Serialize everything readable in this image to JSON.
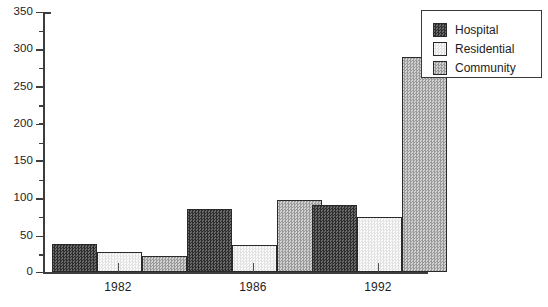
{
  "chart_data": {
    "type": "bar",
    "title": "",
    "xlabel": "",
    "ylabel": "",
    "categories": [
      "1982",
      "1986",
      "1992"
    ],
    "series": [
      {
        "name": "Hospital",
        "values": [
          38,
          85,
          90
        ],
        "pattern": "dark-checker",
        "color": "#4a4a4a"
      },
      {
        "name": "Residential",
        "values": [
          27,
          37,
          74
        ],
        "pattern": "light-checker",
        "color": "#f2f2f2"
      },
      {
        "name": "Community",
        "values": [
          21,
          97,
          290
        ],
        "pattern": "medium-checker",
        "color": "#b4b4b4"
      }
    ],
    "ylim": [
      0,
      350
    ],
    "ytick_major": [
      0,
      50,
      100,
      150,
      200,
      250,
      300,
      350
    ],
    "ytick_minor": [
      25,
      75,
      125,
      175,
      225,
      275,
      325
    ],
    "grid": false,
    "legend_position": "top-right"
  },
  "axis": {
    "y_labels": [
      "350",
      "300",
      "250",
      "200",
      "150",
      "100",
      "50",
      "0"
    ],
    "x_labels": [
      "1982",
      "1986",
      "1992"
    ]
  },
  "legend": {
    "items": [
      {
        "label": "Hospital"
      },
      {
        "label": "Residential"
      },
      {
        "label": "Community"
      }
    ]
  }
}
